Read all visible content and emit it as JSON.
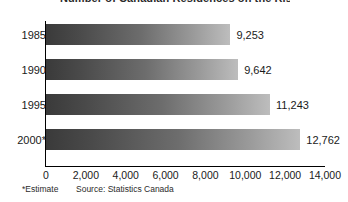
{
  "chart_data": {
    "type": "bar",
    "orientation": "horizontal",
    "title": "Number of Canadian Residences on the Rise",
    "title_visible": "cropped",
    "categories": [
      "1985",
      "1990",
      "1995",
      "2000*"
    ],
    "values": [
      9253,
      9642,
      11243,
      12762
    ],
    "value_labels": [
      "9,253",
      "9,642",
      "11,243",
      "12,762"
    ],
    "xlabel": "",
    "ylabel": "",
    "xlim": [
      0,
      14000
    ],
    "xticks": [
      0,
      2000,
      4000,
      6000,
      8000,
      10000,
      12000,
      14000
    ],
    "xtick_labels": [
      "0",
      "2,000",
      "4,000",
      "6,000",
      "8,000",
      "10,000",
      "12,000",
      "14,000"
    ],
    "grid": false,
    "legend": null,
    "bar_gradient_start": "#3a3a3a",
    "bar_gradient_end": "#bdbdbd",
    "axis_color": "#000000"
  },
  "footnotes": {
    "estimate": "*Estimate",
    "source": "Source: Statistics Canada"
  }
}
